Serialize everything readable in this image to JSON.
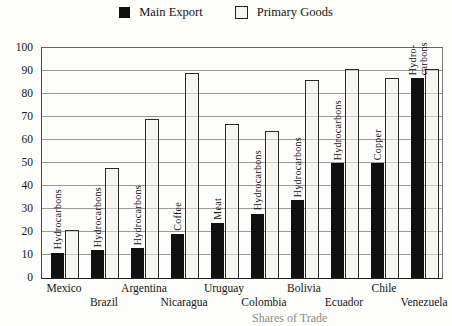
{
  "legend": {
    "main_export": "Main Export",
    "primary_goods": "Primary Goods"
  },
  "chart_data": {
    "type": "bar",
    "title": "",
    "categories": [
      "Mexico",
      "Brazil",
      "Argentina",
      "Nicaragua",
      "Uruguay",
      "Colombia",
      "Bolivia",
      "Ecuador",
      "Chile",
      "Venezuela"
    ],
    "series": [
      {
        "name": "Main Export",
        "color": "#101010",
        "values": [
          11,
          12,
          13,
          19,
          24,
          28,
          34,
          50,
          50,
          87
        ]
      },
      {
        "name": "Primary Goods",
        "color": "#f1efe5",
        "values": [
          21,
          48,
          69,
          89,
          67,
          64,
          86,
          91,
          87,
          91
        ]
      }
    ],
    "bar_labels": [
      "Hydrocarbons",
      "Hydrocarbons",
      "Hydrocarbons",
      "Coffee",
      "Meat",
      "Hydrocarbons",
      "Hydrocarbons",
      "Hydrocarbons",
      "Copper",
      "Hydro-\ncarbons"
    ],
    "y_ticks": [
      0,
      10,
      20,
      30,
      40,
      50,
      60,
      70,
      80,
      90,
      100
    ],
    "ylim": [
      0,
      100
    ],
    "xlabel": "",
    "ylabel": "",
    "grid": "horizontal",
    "legend_position": "top-center"
  },
  "caption_fragment": "Shares of Trade"
}
